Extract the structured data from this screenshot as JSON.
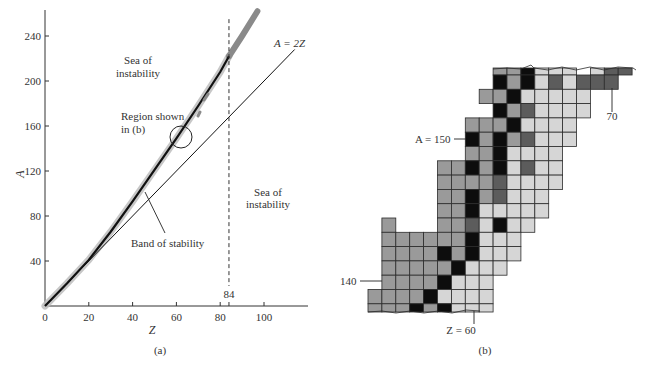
{
  "chart_data": [
    {
      "type": "line",
      "panel": "(a)",
      "title": "",
      "xlabel": "Z",
      "ylabel": "A",
      "xlim": [
        0,
        120
      ],
      "ylim": [
        0,
        265
      ],
      "x_ticks": [
        0,
        20,
        40,
        60,
        80,
        100
      ],
      "y_ticks": [
        40,
        80,
        120,
        160,
        200,
        240
      ],
      "grid": false,
      "series": [
        {
          "name": "Band of stability",
          "style": "thick black curve with gray halo",
          "x": [
            0,
            10,
            20,
            30,
            40,
            50,
            60,
            70,
            80,
            84,
            90,
            97
          ],
          "y": [
            0,
            20,
            41,
            66,
            93,
            121,
            149,
            178,
            208,
            222,
            240,
            262
          ]
        },
        {
          "name": "A = 2Z",
          "style": "thin black line",
          "x": [
            0,
            114
          ],
          "y": [
            0,
            228
          ]
        },
        {
          "name": "Z = 84",
          "style": "dashed vertical line",
          "x": [
            84,
            84
          ],
          "y": [
            0,
            255
          ]
        }
      ],
      "annotations": [
        {
          "text": "Sea of",
          "text2": "instability",
          "x": 30,
          "y": 210
        },
        {
          "text": "Sea of",
          "text2": "instability",
          "x": 105,
          "y": 100
        },
        {
          "text": "Region shown",
          "text2": "in (b)",
          "x": 36,
          "y": 160
        },
        {
          "text": "Band of stability",
          "x": 53,
          "y": 56
        },
        {
          "text": "A = 2Z",
          "x": 113,
          "y": 235
        },
        {
          "text": "84",
          "x": 84,
          "y": 8
        }
      ]
    },
    {
      "type": "heatmap",
      "panel": "(b)",
      "title": "",
      "description": "Enlarged region of the band of stability (nuclide chart cells, Z vs N) shaded by stability class",
      "legend_classes": {
        "K": "black",
        "D": "dark gray",
        "M": "medium gray",
        "L": "light gray"
      },
      "labels": [
        {
          "text": "A = 150"
        },
        {
          "text": "70"
        },
        {
          "text": "140"
        },
        {
          "text": "Z = 60"
        }
      ],
      "rows": [
        "_________MMKLLL_LDD",
        "_________KMKLDLDDD",
        "________MMKLLLLL__",
        "_________KMDLLLL__",
        "_______MMMKLLLL___",
        "_______KMKMDLLL___",
        "_______MMKLLLL____",
        "_____MMKMKLDLL____",
        "_____MMMMDLLLL____",
        "_____MMKMDLLL_____",
        "_____MMKLLLLL_____",
        "_M___MMDLKLL______",
        "_MMMMMMKLLL_______",
        "_MMMMKMKLLL_______",
        "_MMMMMKLLL________",
        "_MMMMKLLL_________",
        "MMMMKLLLL_________",
        "MMMKMKLLL_________"
      ]
    }
  ],
  "panel_a": {
    "x_axis_label": "Z",
    "y_axis_label": "A",
    "x_tick_labels": [
      "0",
      "20",
      "40",
      "60",
      "80",
      "100"
    ],
    "y_tick_labels": [
      "40",
      "80",
      "120",
      "160",
      "200",
      "240"
    ],
    "dashed_line_label": "84",
    "line_label": "A = 2Z",
    "sea_upper": [
      "Sea of",
      "instability"
    ],
    "sea_lower": [
      "Sea of",
      "instability"
    ],
    "region_label": [
      "Region shown",
      "in (b)"
    ],
    "band_label": "Band of stability",
    "caption": "(a)"
  },
  "panel_b": {
    "label_a150": "A = 150",
    "label_70": "70",
    "label_140": "140",
    "label_z60": "Z = 60",
    "caption": "(b)"
  },
  "colors": {
    "K": "#0d0d0d",
    "D": "#5c5c5c",
    "M": "#9a9a9a",
    "L": "#d6d6d6",
    "band_halo": "#b8b8b8",
    "ink": "#222222"
  }
}
